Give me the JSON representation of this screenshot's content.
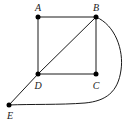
{
  "diagram": {
    "type": "graph",
    "nodes": [
      {
        "id": "A",
        "label": "A",
        "x": 38,
        "y": 17
      },
      {
        "id": "B",
        "label": "B",
        "x": 96,
        "y": 17
      },
      {
        "id": "C",
        "label": "C",
        "x": 96,
        "y": 74
      },
      {
        "id": "D",
        "label": "D",
        "x": 38,
        "y": 74
      },
      {
        "id": "E",
        "label": "E",
        "x": 9,
        "y": 105
      }
    ],
    "edges": [
      {
        "from": "A",
        "to": "B",
        "shape": "straight"
      },
      {
        "from": "A",
        "to": "D",
        "shape": "straight"
      },
      {
        "from": "B",
        "to": "C",
        "shape": "straight"
      },
      {
        "from": "D",
        "to": "C",
        "shape": "straight"
      },
      {
        "from": "B",
        "to": "D",
        "shape": "straight"
      },
      {
        "from": "D",
        "to": "E",
        "shape": "straight"
      },
      {
        "from": "B",
        "to": "E",
        "shape": "curve"
      }
    ]
  }
}
